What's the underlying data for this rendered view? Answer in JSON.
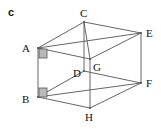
{
  "figure": {
    "part_label": "c",
    "type": "cuboid-net-diagram",
    "stroke_color": "#555555",
    "right_angle_fill": "#b9b9b9",
    "right_angle_stroke": "#555555",
    "background": "#ffffff",
    "vertices": [
      {
        "name": "A",
        "x": 38,
        "y": 48,
        "label_x": 22,
        "label_y": 43
      },
      {
        "name": "B",
        "x": 38,
        "y": 97,
        "label_x": 22,
        "label_y": 94
      },
      {
        "name": "C",
        "x": 84,
        "y": 22,
        "label_x": 80,
        "label_y": 8
      },
      {
        "name": "D",
        "x": 84,
        "y": 71,
        "label_x": 73,
        "label_y": 68
      },
      {
        "name": "E",
        "x": 141,
        "y": 33,
        "label_x": 146,
        "label_y": 28
      },
      {
        "name": "F",
        "x": 141,
        "y": 83,
        "label_x": 146,
        "label_y": 78
      },
      {
        "name": "G",
        "x": 90,
        "y": 59,
        "label_x": 93,
        "label_y": 62
      },
      {
        "name": "H",
        "x": 90,
        "y": 108,
        "label_x": 85,
        "label_y": 112
      }
    ],
    "edges": [
      {
        "from": "A",
        "to": "C"
      },
      {
        "from": "C",
        "to": "E"
      },
      {
        "from": "A",
        "to": "E"
      },
      {
        "from": "A",
        "to": "G"
      },
      {
        "from": "G",
        "to": "E"
      },
      {
        "from": "C",
        "to": "G"
      },
      {
        "from": "A",
        "to": "B"
      },
      {
        "from": "C",
        "to": "D"
      },
      {
        "from": "E",
        "to": "F"
      },
      {
        "from": "G",
        "to": "H"
      },
      {
        "from": "B",
        "to": "D"
      },
      {
        "from": "D",
        "to": "F"
      },
      {
        "from": "B",
        "to": "F"
      },
      {
        "from": "B",
        "to": "H"
      },
      {
        "from": "H",
        "to": "F"
      }
    ],
    "right_angle_markers": [
      {
        "at": "A",
        "x": 39,
        "y": 49,
        "w": 8,
        "h": 9
      },
      {
        "at": "B",
        "x": 39,
        "y": 88,
        "w": 8,
        "h": 9
      }
    ]
  }
}
